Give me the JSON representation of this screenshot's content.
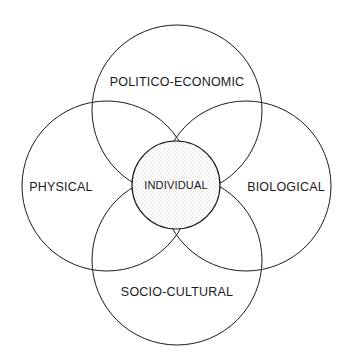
{
  "diagram": {
    "type": "overlapping-circles",
    "center": {
      "label": "INDIVIDUAL",
      "cx": 176,
      "cy": 185,
      "r": 44,
      "fill": "stippled"
    },
    "outer_circles": [
      {
        "id": "top",
        "label": "POLITICO-ECONOMIC",
        "cx": 177,
        "cy": 110,
        "r": 85,
        "label_x": 177,
        "label_y": 86
      },
      {
        "id": "left",
        "label": "PHYSICAL",
        "cx": 107,
        "cy": 186,
        "r": 85,
        "label_x": 61,
        "label_y": 191
      },
      {
        "id": "right",
        "label": "BIOLOGICAL",
        "cx": 246,
        "cy": 186,
        "r": 85,
        "label_x": 286,
        "label_y": 191
      },
      {
        "id": "bottom",
        "label": "SOCIO-CULTURAL",
        "cx": 177,
        "cy": 260,
        "r": 85,
        "label_x": 177,
        "label_y": 296
      }
    ],
    "colors": {
      "stroke": "#1a1a1a",
      "background": "#ffffff",
      "stipple": "#8a8a8a"
    }
  }
}
